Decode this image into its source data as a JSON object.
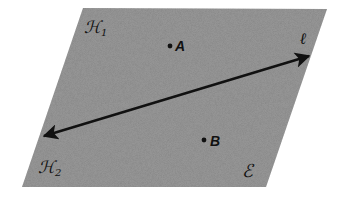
{
  "diagram": {
    "type": "plane-with-line",
    "background_color": "#ffffff",
    "plane": {
      "name": "E",
      "label": "ℰ",
      "fill_color": "#9b9b9b",
      "corners": [
        [
          83,
          8
        ],
        [
          327,
          9
        ],
        [
          266,
          187
        ],
        [
          22,
          187
        ]
      ]
    },
    "line": {
      "name": "ℓ",
      "label": "ℓ",
      "color": "#111111",
      "start": [
        40,
        137
      ],
      "end": [
        313,
        55
      ],
      "arrowheads": "both"
    },
    "half_planes": [
      {
        "name": "H1",
        "label": "ℋ",
        "subscript": "1"
      },
      {
        "name": "H2",
        "label": "ℋ",
        "subscript": "2"
      }
    ],
    "points": [
      {
        "name": "A",
        "label": "A",
        "x": 170,
        "y": 46
      },
      {
        "name": "B",
        "label": "B",
        "x": 204,
        "y": 140
      }
    ]
  }
}
